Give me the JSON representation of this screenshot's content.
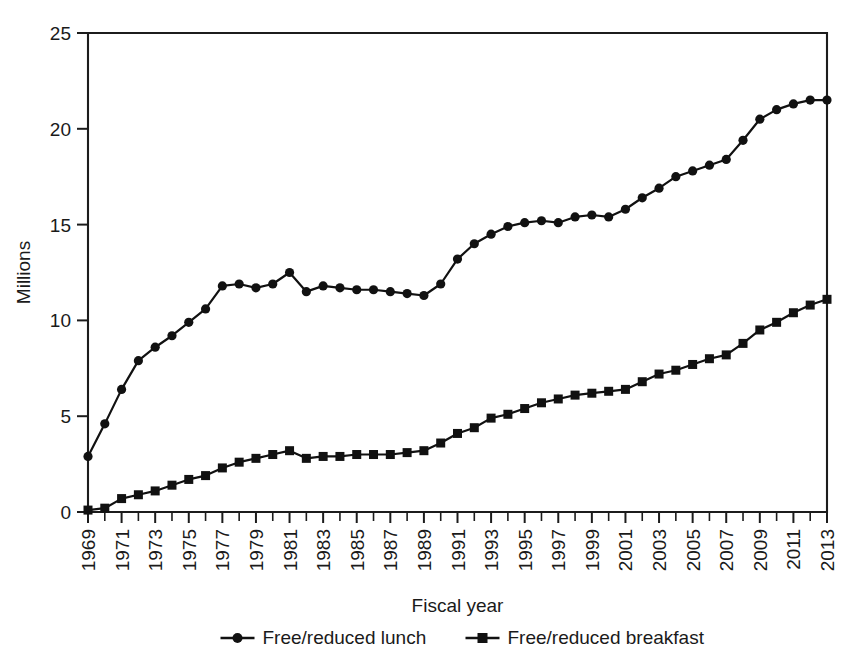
{
  "chart_data": {
    "type": "line",
    "title": "",
    "xlabel": "Fiscal year",
    "ylabel": "Millions",
    "ylim": [
      0,
      25
    ],
    "yticks": [
      0,
      5,
      10,
      15,
      20,
      25
    ],
    "ytick_labels": [
      "0",
      "5",
      "10",
      "15",
      "20",
      "25"
    ],
    "grid": false,
    "legend_position": "bottom",
    "xlim": [
      1969,
      2013
    ],
    "x": [
      1969,
      1970,
      1971,
      1972,
      1973,
      1974,
      1975,
      1976,
      1977,
      1978,
      1979,
      1980,
      1981,
      1982,
      1983,
      1984,
      1985,
      1986,
      1987,
      1988,
      1989,
      1990,
      1991,
      1992,
      1993,
      1994,
      1995,
      1996,
      1997,
      1998,
      1999,
      2000,
      2001,
      2002,
      2003,
      2004,
      2005,
      2006,
      2007,
      2008,
      2009,
      2010,
      2011,
      2012,
      2013
    ],
    "xtick_labels": [
      "1969",
      "1971",
      "1973",
      "1975",
      "1977",
      "1979",
      "1981",
      "1983",
      "1985",
      "1987",
      "1989",
      "1991",
      "1993",
      "1995",
      "1997",
      "1999",
      "2001",
      "2003",
      "2005",
      "2007",
      "2009",
      "2011",
      "2013"
    ],
    "xtick_values": [
      1969,
      1971,
      1973,
      1975,
      1977,
      1979,
      1981,
      1983,
      1985,
      1987,
      1989,
      1991,
      1993,
      1995,
      1997,
      1999,
      2001,
      2003,
      2005,
      2007,
      2009,
      2011,
      2013
    ],
    "series": [
      {
        "name": "Free/reduced lunch",
        "marker": "circle",
        "color": "#111111",
        "values": [
          2.9,
          4.6,
          6.4,
          7.9,
          8.6,
          9.2,
          9.9,
          10.6,
          11.8,
          11.9,
          11.7,
          11.9,
          12.5,
          11.5,
          11.8,
          11.7,
          11.6,
          11.6,
          11.5,
          11.4,
          11.3,
          11.9,
          13.2,
          14.0,
          14.5,
          14.9,
          15.1,
          15.2,
          15.1,
          15.4,
          15.5,
          15.4,
          15.8,
          16.4,
          16.9,
          17.5,
          17.8,
          18.1,
          18.4,
          19.4,
          20.5,
          21.0,
          21.3,
          21.5,
          21.5
        ]
      },
      {
        "name": "Free/reduced breakfast",
        "marker": "square",
        "color": "#111111",
        "values": [
          0.1,
          0.2,
          0.7,
          0.9,
          1.1,
          1.4,
          1.7,
          1.9,
          2.3,
          2.6,
          2.8,
          3.0,
          3.2,
          2.8,
          2.9,
          2.9,
          3.0,
          3.0,
          3.0,
          3.1,
          3.2,
          3.6,
          4.1,
          4.4,
          4.9,
          5.1,
          5.4,
          5.7,
          5.9,
          6.1,
          6.2,
          6.3,
          6.4,
          6.8,
          7.2,
          7.4,
          7.7,
          8.0,
          8.2,
          8.8,
          9.5,
          9.9,
          10.4,
          10.8,
          11.1
        ]
      }
    ]
  },
  "legend": {
    "items": [
      {
        "label": "Free/reduced lunch",
        "marker": "circle"
      },
      {
        "label": "Free/reduced breakfast",
        "marker": "square"
      }
    ]
  },
  "axes": {
    "y_title": "Millions",
    "x_title": "Fiscal year"
  }
}
